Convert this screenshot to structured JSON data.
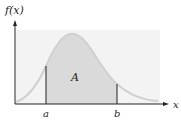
{
  "diagram": {
    "y_axis_label": "f(x)",
    "x_axis_label": "x",
    "area_label": "A",
    "bound_a_label": "a",
    "bound_b_label": "b",
    "colors": {
      "background_panel": "#f2f2f2",
      "shaded_area": "#d9d9d9",
      "curve": "#d0d0d0",
      "axes": "#222222",
      "bounds": "#222222"
    }
  }
}
